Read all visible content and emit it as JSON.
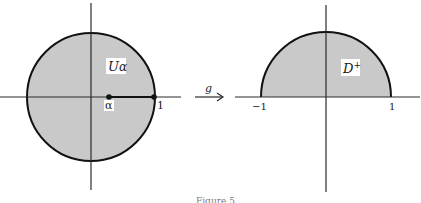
{
  "figure": {
    "caption": "Figure 5",
    "colors": {
      "fill": "#c9c9c9",
      "stroke": "#111111",
      "axis": "#2a2a2a",
      "background": "#ffffff"
    }
  },
  "left_panel": {
    "region_label_main": "U",
    "region_label_sub": "α",
    "point_alpha_label": "α",
    "point_one_label": "1",
    "shape": "unit disk"
  },
  "map_arrow": {
    "label": "g"
  },
  "right_panel": {
    "region_label_main": "D",
    "region_label_sup": "+",
    "tick_left_label": "−1",
    "tick_right_label": "1",
    "shape": "upper half disk"
  }
}
